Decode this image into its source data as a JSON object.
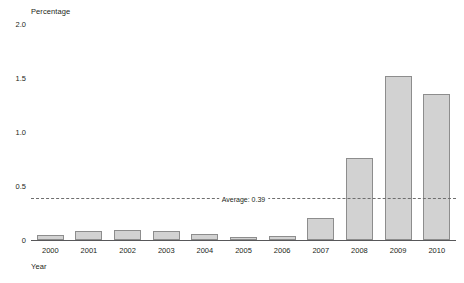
{
  "chart_data": {
    "type": "bar",
    "title": "",
    "xlabel": "Year",
    "ylabel": "Percentage",
    "categories": [
      "2000",
      "2001",
      "2002",
      "2003",
      "2004",
      "2005",
      "2006",
      "2007",
      "2008",
      "2009",
      "2010"
    ],
    "values": [
      0.05,
      0.08,
      0.09,
      0.08,
      0.06,
      0.03,
      0.04,
      0.2,
      0.76,
      1.52,
      1.35
    ],
    "ylim": [
      0,
      2.0
    ],
    "yticks": [
      0,
      0.5,
      1.0,
      1.5,
      2.0
    ],
    "ytick_labels": [
      "0",
      "0.5",
      "1.0",
      "1.5",
      "2.0"
    ],
    "grid": false,
    "legend": "none",
    "annotations": [
      {
        "name": "average-line",
        "label": "Average: 0.39",
        "value": 0.39,
        "style": "dashed-horizontal"
      }
    ],
    "colors": {
      "bar_fill": "#d2d2d2",
      "bar_border": "#8d8d8d",
      "axis": "#58585a",
      "text": "#231f20",
      "average_line": "#6e6e6e",
      "background": "#ffffff"
    }
  }
}
